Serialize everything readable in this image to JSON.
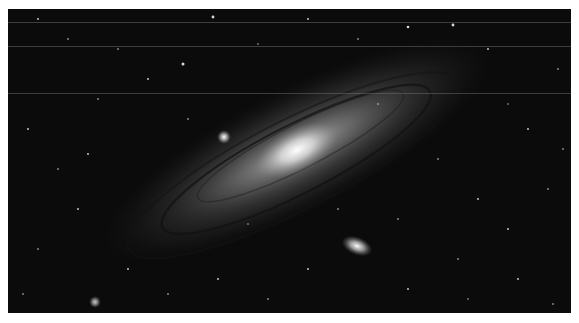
{
  "image": {
    "subject": "Andromeda galaxy",
    "description": "Grayscale astrophotograph of a large spiral galaxy with two small companion galaxies against a dense star field",
    "colors": {
      "background": "#0b0b0b",
      "border": "#ffffff",
      "core": "#f4f4f4",
      "disk": "#6e6e6e"
    },
    "features": [
      {
        "name": "galaxy-core",
        "x": 297,
        "y": 150
      },
      {
        "name": "companion-galaxy-upper",
        "x": 224,
        "y": 137
      },
      {
        "name": "companion-galaxy-lower",
        "x": 357,
        "y": 246
      },
      {
        "name": "bright-star-lower-left",
        "x": 95,
        "y": 302
      }
    ],
    "streak_lines_y": [
      22,
      46,
      93
    ]
  }
}
